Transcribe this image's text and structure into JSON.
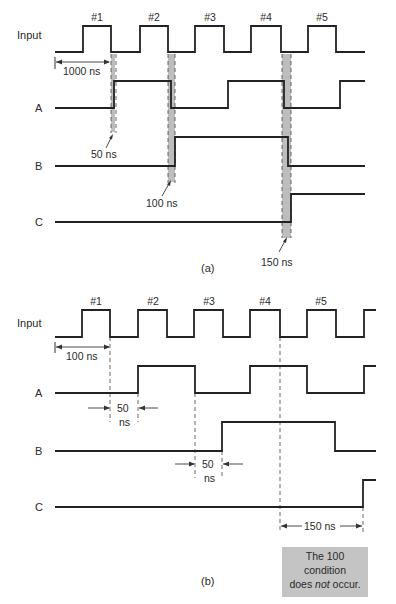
{
  "figure": {
    "panel_a": {
      "caption": "(a)",
      "pulse_labels": [
        "#1",
        "#2",
        "#3",
        "#4",
        "#5"
      ],
      "signal_labels": [
        "Input",
        "A",
        "B",
        "C"
      ],
      "period_label": "1000 ns",
      "delay_labels": [
        "50 ns",
        "100 ns",
        "150 ns"
      ]
    },
    "panel_b": {
      "caption": "(b)",
      "pulse_labels": [
        "#1",
        "#2",
        "#3",
        "#4",
        "#5"
      ],
      "signal_labels": [
        "Input",
        "A",
        "B",
        "C"
      ],
      "period_label": "100 ns",
      "delay_a_value": "50",
      "delay_a_unit": "ns",
      "delay_b_value": "50",
      "delay_b_unit": "ns",
      "delay_c_label": "150 ns",
      "note_line1": "The 100",
      "note_line2": "condition",
      "note_line3_pre": "does ",
      "note_line3_em": "not",
      "note_line3_post": " occur."
    },
    "colors": {
      "waveform": "#222222",
      "shading": "#bdbdbd",
      "note_background": "#c4c4c4"
    }
  },
  "waveforms": {
    "panel_a": {
      "input": "M55,52 H83 V26 H111 V52 H140 V26 H168 V52 H195 V26 H224 V52 H251 V26 H281 V52 H308 V26 H336 V52 H365",
      "a": "M55,108 H114 V81 H171 V108 H228 V81 H284 V108 H340 V81 H365",
      "b": "M55,166 H175 V137 H288 V166 H365",
      "c": "M55,222 H291 V194 H365"
    },
    "panel_b": {
      "input": "M55,337 H82 V310 H110 V337 H138 V310 H167 V337 H194 V310 H223 V337 H250 V310 H280 V337 H307 V310 H336 V337 H364 V310 H376",
      "a": "M55,393 H138 V366 H195 V393 H250 V366 H307 V393 H364 V366 H376",
      "b": "M55,451 H222 V422 H335 V451 H376",
      "c": "M55,507 H363 V480 H376"
    }
  }
}
